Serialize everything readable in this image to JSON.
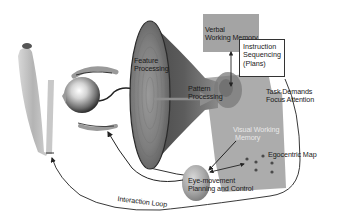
{
  "diagram": {
    "type": "cognitive-architecture-diagram",
    "colors": {
      "background": "#ffffff",
      "funnel_dark": "#3a3a3a",
      "funnel_mid": "#7a7a7a",
      "funnel_light": "#b0b0b0",
      "panel_gray": "#a8a8a8",
      "verbal_box": "#a0a0a0",
      "line": "#222222"
    },
    "labels": {
      "feature_processing": [
        "Feature",
        "Processing"
      ],
      "pattern_processing": [
        "Pattern",
        "Processing"
      ],
      "verbal_working_memory": [
        "Verbal",
        "Working Memory"
      ],
      "instruction_sequencing": [
        "Instruction",
        "Sequencing",
        "(Plans)"
      ],
      "task_demands": [
        "Task Demands",
        "Focus Attention"
      ],
      "visual_working_memory": [
        "Visual Working",
        "Memory"
      ],
      "egocentric_map": "Egocentric Map",
      "eye_movement": [
        "Eye-movement",
        "Planning and Control"
      ],
      "interaction_loop": "Interaction Loop"
    },
    "nodes": [
      {
        "id": "display-screen",
        "label": "display/screen surface"
      },
      {
        "id": "eye",
        "label": "eye"
      },
      {
        "id": "feature-processing",
        "label": "Feature Processing"
      },
      {
        "id": "pattern-processing",
        "label": "Pattern Processing"
      },
      {
        "id": "verbal-working-memory",
        "label": "Verbal Working Memory"
      },
      {
        "id": "instruction-sequencing",
        "label": "Instruction Sequencing (Plans)"
      },
      {
        "id": "task-demands",
        "label": "Task Demands Focus Attention"
      },
      {
        "id": "visual-working-memory",
        "label": "Visual Working Memory"
      },
      {
        "id": "egocentric-map",
        "label": "Egocentric Map"
      },
      {
        "id": "eye-movement-control",
        "label": "Eye-movement Planning and Control"
      }
    ],
    "edges": [
      {
        "from": "verbal-working-memory",
        "to": "task-demands",
        "direction": "both"
      },
      {
        "from": "feature-processing",
        "to": "pattern-processing",
        "direction": "forward"
      },
      {
        "from": "visual-working-memory",
        "to": "eye-movement-control",
        "direction": "forward"
      },
      {
        "from": "egocentric-map",
        "to": "eye-movement-control",
        "direction": "both"
      },
      {
        "from": "eye-movement-control",
        "to": "eye",
        "direction": "forward"
      },
      {
        "from": "instruction-sequencing",
        "to": "display-screen",
        "label": "Interaction Loop",
        "direction": "forward"
      }
    ]
  }
}
